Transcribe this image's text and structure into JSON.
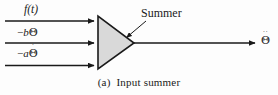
{
  "figure": {
    "caption_index": "(a)",
    "caption_text": "Input summer",
    "background_color": "#fdfdfd",
    "line_color": "#1a1a1a",
    "block_fill_color": "#d9d9d9",
    "block_stroke_color": "#1a1a1a"
  },
  "block": {
    "name": "Summer",
    "annotation_label": "Summer",
    "shape": "triangle"
  },
  "inputs": [
    {
      "id": "forcing-function",
      "label": "f(t)",
      "sign": "",
      "base": "f(t)",
      "dots": 0
    },
    {
      "id": "position-feedback",
      "label": "−bΘ",
      "sign": "−",
      "coefficient": "b",
      "base": "Θ",
      "dots": 0
    },
    {
      "id": "velocity-feedback",
      "label": "−aΘ̇",
      "sign": "−",
      "coefficient": "a",
      "base": "Θ",
      "dots": 1
    }
  ],
  "output": {
    "id": "acceleration",
    "label": "Θ̈",
    "base": "Θ",
    "dots": 2
  }
}
